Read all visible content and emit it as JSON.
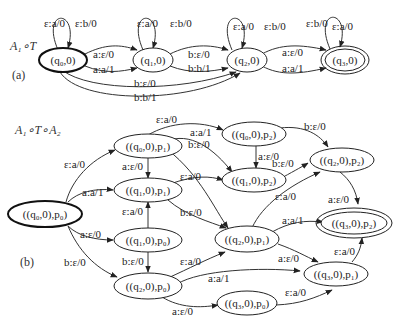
{
  "part_a": {
    "title": "A₁∘T",
    "label": "(a)",
    "nodes": {
      "q0": "(q₀,0)",
      "q1": "(q₁,0)",
      "q2": "(q₂,0)",
      "q3": "(q₃,0)"
    },
    "edges": {
      "q0_loop_1": "ε:a/0",
      "q0_loop_2": "ε:b/0",
      "q1_loop_1": "ε:a/0",
      "q1_loop_2": "ε:b/0",
      "q2_loop_1": "ε:a/0",
      "q2_loop_2": "ε:b/0",
      "q3_loop_1": "ε:b/0",
      "q3_loop_2": "ε:a/0",
      "q0_q1_1": "a:ε/0",
      "q0_q1_2": "a:a/1",
      "q1_q2_1": "b:ε/0",
      "q1_q2_2": "b:b/1",
      "q2_q3_1": "a:ε/0",
      "q2_q3_2": "a:a/1",
      "q0_q2_1": "b:ε/0",
      "q0_q2_2": "b:b/1"
    }
  },
  "part_b": {
    "title": "A₁∘T∘A₂",
    "label": "(b)",
    "nodes": {
      "q0p0": "((q₀,0),p₀)",
      "q0p1": "((q₀,0),p₁)",
      "q1p1": "((q₁,0),p₁)",
      "q1p0": "((q₁,0),p₀)",
      "q2p0": "((q₂,0),p₀)",
      "q0p2": "((q₀,0),p₂)",
      "q1p2": "((q₁,0),p₂)",
      "q2p2": "((q₂,0),p₂)",
      "q2p1": "((q₂,0),p₁)",
      "q3p2": "((q₃,0),p₂)",
      "q3p1": "((q₃,0),p₁)",
      "q3p0": "((q₃,0),p₀)"
    },
    "edges": {
      "q0p0_q0p1": "ε:a/0",
      "q0p0_q1p1": "a:a/1",
      "q0p0_q1p0": "a:ε/0",
      "q0p0_q2p0": "b:ε/0",
      "q0p1_q0p2": "ε:a/0",
      "q0p1_q1p2": "a:a/1",
      "q0p1_q1p1": "a:ε/0",
      "q0p1_q2p1": "b:ε/0",
      "q1p0_q1p1": "ε:a/0",
      "q1p0_q2p0": "b:ε/0",
      "q1p1_q1p2": "ε:a/0",
      "q1p1_q2p1": "b:ε/0",
      "q0p2_q1p2": "a:ε/0",
      "q0p2_q2p2": "b:ε/0",
      "q1p2_q2p2": "b:ε/0",
      "q2p1_q2p2": "ε:a/0",
      "q2p2_q3p2": "a:ε/0",
      "q2p1_q3p2": "a:a/1",
      "q2p1_q3p1": "a:ε/0",
      "q2p0_q2p1": "ε:a/0",
      "q2p0_q3p1": "a:a/1",
      "q2p0_q3p0": "a:ε/0",
      "q3p0_q3p1": "ε:a/0",
      "q3p1_q3p2": "ε:a/0"
    }
  }
}
